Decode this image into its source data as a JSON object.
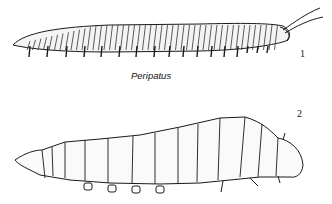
{
  "figure": {
    "illustrations": [
      {
        "number": "1",
        "caption": "Peripatus",
        "subject": "peripatus-drawing"
      },
      {
        "number": "2",
        "caption": "",
        "subject": "caterpillar-drawing"
      }
    ],
    "colors": {
      "ink": "#1a1a1a",
      "paper": "#ffffff"
    }
  }
}
